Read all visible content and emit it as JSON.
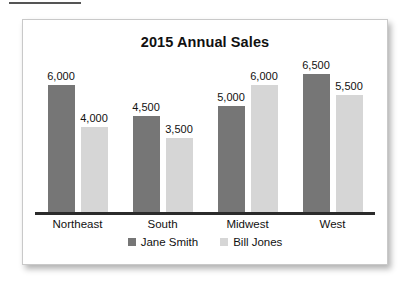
{
  "top_rule": {
    "present": true
  },
  "card": {
    "border_color": "#c9c9c9",
    "background": "#ffffff"
  },
  "chart_data": {
    "type": "bar",
    "title": "2015 Annual Sales",
    "xlabel": "",
    "ylabel": "",
    "ylim": [
      0,
      6500
    ],
    "grid": false,
    "legend_position": "bottom",
    "categories": [
      "Northeast",
      "South",
      "Midwest",
      "West"
    ],
    "series": [
      {
        "name": "Jane Smith",
        "color": "#767676",
        "values": [
          6000,
          4500,
          5000,
          6500
        ],
        "labels": [
          "6,000",
          "4,500",
          "5,000",
          "6,500"
        ]
      },
      {
        "name": "Bill Jones",
        "color": "#d6d6d6",
        "values": [
          4000,
          3500,
          6000,
          5500
        ],
        "labels": [
          "4,000",
          "3,500",
          "6,000",
          "5,500"
        ]
      }
    ]
  }
}
